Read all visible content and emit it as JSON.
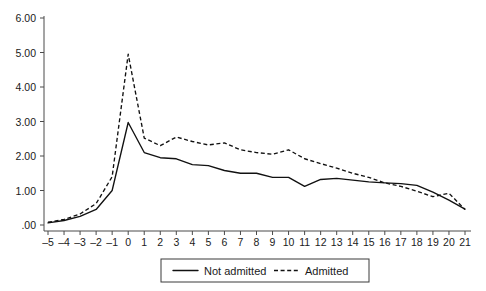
{
  "chart_data": {
    "type": "line",
    "title": "",
    "subtitle": "",
    "xlabel": "",
    "ylabel": "",
    "x": [
      -5,
      -4,
      -3,
      -2,
      -1,
      0,
      1,
      2,
      3,
      4,
      5,
      6,
      7,
      8,
      9,
      10,
      11,
      12,
      13,
      14,
      15,
      16,
      17,
      18,
      19,
      20,
      21
    ],
    "xlim": [
      -5,
      21
    ],
    "ylim": [
      0,
      6
    ],
    "grid": false,
    "legend_position": "bottom-center",
    "ytick_labels": [
      "6.00",
      "5.00",
      "4.00",
      "3.00",
      "2.00",
      "1.00",
      ".00"
    ],
    "ytick_values": [
      6,
      5,
      4,
      3,
      2,
      1,
      0
    ],
    "xtick_labels": [
      "–5",
      "–4",
      "–3",
      "–2",
      "–1",
      "0",
      "1",
      "2",
      "3",
      "4",
      "5",
      "6",
      "7",
      "8",
      "9",
      "10",
      "11",
      "12",
      "13",
      "14",
      "15",
      "16",
      "17",
      "18",
      "19",
      "20",
      "21"
    ],
    "series": [
      {
        "name": "Not admitted",
        "style": "solid",
        "values": [
          0.06,
          0.13,
          0.25,
          0.45,
          1.0,
          2.97,
          2.1,
          1.95,
          1.92,
          1.75,
          1.72,
          1.58,
          1.5,
          1.5,
          1.38,
          1.38,
          1.12,
          1.32,
          1.35,
          1.3,
          1.25,
          1.22,
          1.2,
          1.15,
          0.95,
          0.72,
          0.46
        ]
      },
      {
        "name": "Admitted",
        "style": "dashed",
        "values": [
          0.08,
          0.16,
          0.32,
          0.62,
          1.4,
          4.95,
          2.52,
          2.3,
          2.55,
          2.42,
          2.32,
          2.38,
          2.18,
          2.1,
          2.05,
          2.18,
          1.92,
          1.78,
          1.65,
          1.5,
          1.38,
          1.22,
          1.12,
          0.98,
          0.82,
          0.92,
          0.45
        ]
      }
    ]
  },
  "legend": {
    "items": [
      {
        "label": "Not admitted",
        "style": "solid"
      },
      {
        "label": "Admitted",
        "style": "dashed"
      }
    ]
  }
}
